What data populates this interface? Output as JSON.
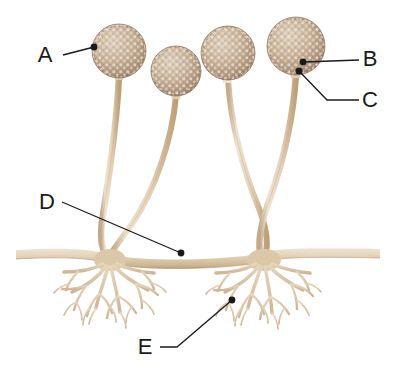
{
  "diagram": {
    "background_color": "#ffffff",
    "colors": {
      "sporangium_fill": "#c9b29a",
      "sporangium_speckle": "#efe4d6",
      "sporangium_outline": "#8d7560",
      "stalk_fill": "#e7d7c0",
      "stalk_edge": "#c0a888",
      "stolon_fill": "#e2d2b9",
      "stolon_edge": "#bda682",
      "rhizoid_fill": "#d8c5ab",
      "leader_line": "#1a1a1a",
      "label_text": "#1a1a1a"
    },
    "labels": [
      {
        "id": "A",
        "text": "A",
        "text_x": 45,
        "text_y": 62,
        "dot_x": 94,
        "dot_y": 47,
        "target": "sporangium-left-edge",
        "path": "M 63 55 L 94 47"
      },
      {
        "id": "B",
        "text": "B",
        "text_x": 365,
        "text_y": 66,
        "dot_x": 303,
        "dot_y": 62,
        "target": "columella-apophysis",
        "path": "M 359 60 L 303 62"
      },
      {
        "id": "C",
        "text": "C",
        "text_x": 365,
        "text_y": 106,
        "dot_x": 299,
        "dot_y": 71,
        "target": "sporangiophore-apex",
        "path": "M 359 100 L 327 100 L 299 71"
      },
      {
        "id": "D",
        "text": "D",
        "text_x": 44,
        "text_y": 208,
        "dot_x": 181,
        "dot_y": 253,
        "target": "stolon",
        "path": "M 62 202 L 181 253"
      },
      {
        "id": "E",
        "text": "E",
        "text_x": 141,
        "text_y": 353,
        "dot_x": 232,
        "dot_y": 300,
        "target": "rhizoid",
        "path": "M 160 347 L 177 347 L 232 300"
      }
    ],
    "sporangia": [
      {
        "id": "sporangium-1",
        "cx": 119,
        "cy": 51,
        "r": 27
      },
      {
        "id": "sporangium-2",
        "cx": 176,
        "cy": 71,
        "r": 25
      },
      {
        "id": "sporangium-3",
        "cx": 228,
        "cy": 53,
        "r": 27
      },
      {
        "id": "sporangium-4",
        "cx": 296,
        "cy": 46,
        "r": 29
      }
    ],
    "stolon": {
      "y": 252,
      "x_start": 16,
      "x_end": 380,
      "thickness": 9
    },
    "rhizoid_clusters": [
      {
        "id": "rhizoid-cluster-left",
        "cx": 110,
        "cy": 256
      },
      {
        "id": "rhizoid-cluster-right",
        "cx": 265,
        "cy": 256
      }
    ]
  }
}
